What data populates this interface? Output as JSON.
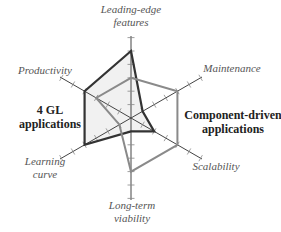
{
  "chart_data": {
    "type": "radar",
    "title": "",
    "axes": [
      {
        "label_lines": [
          "Leading-edge",
          "features"
        ]
      },
      {
        "label_lines": [
          "Maintenance"
        ]
      },
      {
        "label_lines": [
          "Scalability"
        ]
      },
      {
        "label_lines": [
          "Long-term",
          "viability"
        ]
      },
      {
        "label_lines": [
          "Learning",
          "curve"
        ]
      },
      {
        "label_lines": [
          "Productivity"
        ]
      }
    ],
    "range": [
      0,
      6
    ],
    "tick_count": 6,
    "series": [
      {
        "name_lines": [
          "4 GL",
          "applications"
        ],
        "values": [
          5,
          1,
          2,
          1,
          4,
          4
        ],
        "color": "#333333",
        "fill": "#f1f1f1"
      },
      {
        "name_lines": [
          "Component-driven",
          "applications"
        ],
        "values": [
          3,
          4,
          4,
          4,
          1,
          3
        ],
        "color": "#8a8a8a",
        "fill": "none"
      }
    ],
    "legend": "inline-labels-left-right",
    "grid": false
  }
}
